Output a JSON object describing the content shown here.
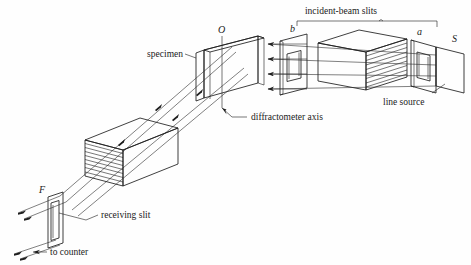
{
  "figure": {
    "kind": "x-ray-diffractometer-optics-schematic",
    "background_color": "#fefefe",
    "ink_color": "#1d1d1d"
  },
  "labels": {
    "incident_beam_slits": "incident-beam slits",
    "specimen": "specimen",
    "diffractometer_axis": "diffractometer axis",
    "line_source": "line source",
    "receiving_slit": "receiving slit",
    "to_counter": "to counter",
    "point_o": "O",
    "point_b": "b",
    "point_a": "a",
    "point_s": "S",
    "point_f": "F"
  },
  "components": [
    {
      "id": "line-source-S",
      "label": "S",
      "role": "x-ray line source frame"
    },
    {
      "id": "slit-a",
      "label": "a",
      "role": "incident-beam slit a"
    },
    {
      "id": "incident-soller-box",
      "label": "",
      "role": "incident-beam Soller slit assembly"
    },
    {
      "id": "slit-b",
      "label": "b",
      "role": "incident-beam slit b"
    },
    {
      "id": "specimen-slab",
      "label": "specimen",
      "role": "flat powder specimen at axis O"
    },
    {
      "id": "diffractometer-axis",
      "label": "diffractometer axis",
      "role": "vertical rotation axis through O"
    },
    {
      "id": "receiving-soller-box",
      "label": "",
      "role": "receiving Soller slit assembly"
    },
    {
      "id": "receiving-slit-F",
      "label": "F",
      "role": "receiving slit F"
    },
    {
      "id": "counter-exit",
      "label": "to counter",
      "role": "diffracted beam to detector"
    }
  ],
  "colors": {
    "box_top_dark": "#6e6e6e",
    "box_front_light": "#d2d2d2",
    "box_side_mid": "#b6b6b6",
    "plate_face": "#cfcfcf",
    "plate_edge_dark": "#2a2a2a",
    "specimen_fill": "#e3e3e3",
    "stroke": "#1d1d1d"
  },
  "brace": {
    "spans_from": "b",
    "spans_to": "a",
    "label": "incident-beam slits"
  }
}
